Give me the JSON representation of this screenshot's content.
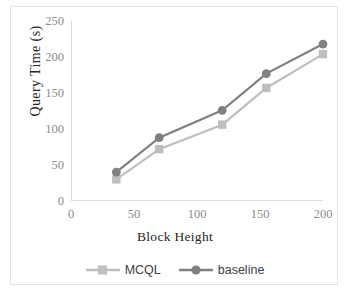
{
  "chart_data": {
    "type": "line",
    "title": "",
    "xlabel": "Block Height",
    "ylabel": "Query  Time (s)",
    "xlim": [
      0,
      200
    ],
    "ylim": [
      0,
      250
    ],
    "xticks": [
      0,
      50,
      100,
      150,
      200
    ],
    "yticks": [
      0,
      50,
      100,
      150,
      200,
      250
    ],
    "grid": false,
    "legend_position": "bottom",
    "x": [
      36,
      70,
      120,
      155,
      200
    ],
    "series": [
      {
        "name": "MCQL",
        "color": "#bfbfbf",
        "marker": "square",
        "values": [
          30,
          72,
          106,
          157,
          204
        ]
      },
      {
        "name": "baseline",
        "color": "#808080",
        "marker": "circle",
        "values": [
          40,
          88,
          126,
          177,
          218
        ]
      }
    ]
  },
  "legend": {
    "items": [
      {
        "label": "MCQL"
      },
      {
        "label": "baseline"
      }
    ]
  },
  "axes": {
    "x_tick_labels": [
      "0",
      "50",
      "100",
      "150",
      "200"
    ],
    "y_tick_labels": [
      "0",
      "50",
      "100",
      "150",
      "200",
      "250"
    ],
    "x_title": "Block Height",
    "y_title": "Query  Time (s)"
  },
  "colors": {
    "mcql": "#bfbfbf",
    "baseline": "#808080",
    "axis": "#d9d9d9",
    "tick_text": "#8c8c8c",
    "title_text": "#262626",
    "frame": "#e3e3e3"
  }
}
